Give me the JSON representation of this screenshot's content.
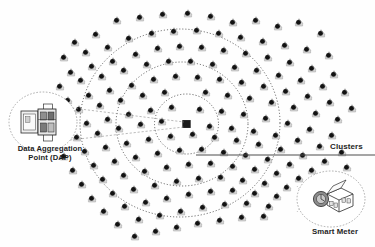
{
  "diagram": {
    "type": "network-topology",
    "background_color": "#fefefe",
    "ink_color": "#1a1a1a",
    "node_body_color": "#d9d9d9",
    "node_dot_color": "#141414",
    "ring_color": "#3a3a3a",
    "leader_color": "#555555"
  },
  "labels": {
    "dap": {
      "line1": "Data Aggregation",
      "line2": "Point (DAP)"
    },
    "smart_meter": "Smart Meter",
    "clusters": "Clusters"
  },
  "center_node": {
    "name": "data-aggregation-point",
    "shape": "square",
    "x": 186.5,
    "y": 124.0,
    "size": 7.5,
    "color": "#1b1b1b"
  },
  "cluster_rings": [
    {
      "id": "ring-inner",
      "cx": 186.5,
      "cy": 124.0,
      "rx": 32,
      "ry": 30,
      "dash": "1.1 2.0"
    },
    {
      "id": "ring-middle",
      "cx": 182.0,
      "cy": 124.0,
      "rx": 66,
      "ry": 62,
      "dash": "1.1 2.0"
    },
    {
      "id": "ring-outer",
      "cx": 180.0,
      "cy": 123.0,
      "rx": 100,
      "ry": 94,
      "dash": "1.1 2.0"
    }
  ],
  "clusters_leader": {
    "x1": 196,
    "y1": 155,
    "x2": 375,
    "y2": 155
  },
  "dap_callout": {
    "circle": {
      "cx": 43,
      "cy": 122,
      "rx": 34,
      "ry": 30
    },
    "leader_wedge": [
      {
        "x1": 72,
        "y1": 108,
        "x2": 184,
        "y2": 122
      },
      {
        "x1": 70,
        "y1": 140,
        "x2": 184,
        "y2": 127
      }
    ]
  },
  "smart_meter_callout": {
    "circle": {
      "cx": 331,
      "cy": 199,
      "rx": 34,
      "ry": 28
    },
    "leader_wedge": [
      {
        "x1": 300,
        "y1": 190,
        "x2": 297,
        "y2": 186
      },
      {
        "x1": 300,
        "y1": 208,
        "x2": 297,
        "y2": 212
      }
    ]
  },
  "meter_nodes": [
    [
      75,
      42
    ],
    [
      96,
      34
    ],
    [
      117,
      20
    ],
    [
      140,
      17
    ],
    [
      163,
      14
    ],
    [
      188,
      13
    ],
    [
      211,
      16
    ],
    [
      233,
      22
    ],
    [
      256,
      20
    ],
    [
      278,
      26
    ],
    [
      299,
      22
    ],
    [
      321,
      33
    ],
    [
      64,
      57
    ],
    [
      86,
      52
    ],
    [
      108,
      47
    ],
    [
      129,
      38
    ],
    [
      152,
      33
    ],
    [
      174,
      31
    ],
    [
      197,
      30
    ],
    [
      219,
      33
    ],
    [
      241,
      37
    ],
    [
      263,
      41
    ],
    [
      285,
      45
    ],
    [
      307,
      49
    ],
    [
      329,
      55
    ],
    [
      71,
      72
    ],
    [
      92,
      66
    ],
    [
      113,
      61
    ],
    [
      136,
      54
    ],
    [
      158,
      48
    ],
    [
      180,
      46
    ],
    [
      202,
      47
    ],
    [
      224,
      50
    ],
    [
      246,
      53
    ],
    [
      268,
      57
    ],
    [
      290,
      62
    ],
    [
      312,
      68
    ],
    [
      334,
      74
    ],
    [
      60,
      86
    ],
    [
      81,
      80
    ],
    [
      102,
      76
    ],
    [
      124,
      70
    ],
    [
      147,
      64
    ],
    [
      169,
      61
    ],
    [
      191,
      61
    ],
    [
      213,
      64
    ],
    [
      235,
      67
    ],
    [
      257,
      70
    ],
    [
      279,
      75
    ],
    [
      301,
      80
    ],
    [
      323,
      86
    ],
    [
      345,
      92
    ],
    [
      68,
      100
    ],
    [
      89,
      95
    ],
    [
      110,
      90
    ],
    [
      132,
      85
    ],
    [
      154,
      79
    ],
    [
      176,
      76
    ],
    [
      198,
      77
    ],
    [
      220,
      79
    ],
    [
      242,
      82
    ],
    [
      264,
      86
    ],
    [
      286,
      91
    ],
    [
      308,
      96
    ],
    [
      330,
      102
    ],
    [
      352,
      108
    ],
    [
      58,
      114
    ],
    [
      79,
      109
    ],
    [
      100,
      105
    ],
    [
      121,
      100
    ],
    [
      143,
      95
    ],
    [
      165,
      92
    ],
    [
      206,
      92
    ],
    [
      228,
      95
    ],
    [
      250,
      98
    ],
    [
      272,
      102
    ],
    [
      294,
      107
    ],
    [
      316,
      113
    ],
    [
      338,
      119
    ],
    [
      66,
      128
    ],
    [
      87,
      123
    ],
    [
      108,
      119
    ],
    [
      129,
      114
    ],
    [
      151,
      110
    ],
    [
      172,
      107
    ],
    [
      200,
      109
    ],
    [
      222,
      111
    ],
    [
      244,
      114
    ],
    [
      266,
      118
    ],
    [
      288,
      123
    ],
    [
      310,
      129
    ],
    [
      332,
      135
    ],
    [
      56,
      142
    ],
    [
      77,
      137
    ],
    [
      98,
      133
    ],
    [
      119,
      128
    ],
    [
      141,
      124
    ],
    [
      162,
      121
    ],
    [
      210,
      126
    ],
    [
      232,
      128
    ],
    [
      254,
      131
    ],
    [
      276,
      135
    ],
    [
      298,
      140
    ],
    [
      320,
      146
    ],
    [
      342,
      152
    ],
    [
      64,
      156
    ],
    [
      85,
      151
    ],
    [
      106,
      147
    ],
    [
      127,
      143
    ],
    [
      149,
      139
    ],
    [
      171,
      136
    ],
    [
      193,
      134
    ],
    [
      215,
      137
    ],
    [
      237,
      140
    ],
    [
      259,
      144
    ],
    [
      281,
      149
    ],
    [
      303,
      155
    ],
    [
      325,
      161
    ],
    [
      347,
      167
    ],
    [
      73,
      170
    ],
    [
      94,
      165
    ],
    [
      115,
      161
    ],
    [
      136,
      157
    ],
    [
      158,
      153
    ],
    [
      180,
      150
    ],
    [
      202,
      149
    ],
    [
      224,
      152
    ],
    [
      246,
      155
    ],
    [
      268,
      159
    ],
    [
      290,
      164
    ],
    [
      312,
      170
    ],
    [
      82,
      184
    ],
    [
      103,
      179
    ],
    [
      124,
      175
    ],
    [
      145,
      171
    ],
    [
      167,
      167
    ],
    [
      189,
      164
    ],
    [
      211,
      163
    ],
    [
      233,
      166
    ],
    [
      255,
      169
    ],
    [
      277,
      173
    ],
    [
      299,
      178
    ],
    [
      92,
      198
    ],
    [
      113,
      193
    ],
    [
      134,
      189
    ],
    [
      155,
      185
    ],
    [
      177,
      181
    ],
    [
      199,
      178
    ],
    [
      221,
      177
    ],
    [
      243,
      180
    ],
    [
      265,
      183
    ],
    [
      287,
      187
    ],
    [
      104,
      211
    ],
    [
      125,
      206
    ],
    [
      146,
      202
    ],
    [
      167,
      198
    ],
    [
      189,
      194
    ],
    [
      211,
      191
    ],
    [
      233,
      190
    ],
    [
      255,
      193
    ],
    [
      277,
      196
    ],
    [
      118,
      224
    ],
    [
      139,
      219
    ],
    [
      160,
      215
    ],
    [
      181,
      211
    ],
    [
      203,
      207
    ],
    [
      225,
      204
    ],
    [
      247,
      203
    ],
    [
      269,
      206
    ],
    [
      135,
      236
    ],
    [
      156,
      231
    ],
    [
      177,
      227
    ],
    [
      198,
      223
    ],
    [
      220,
      220
    ],
    [
      242,
      217
    ],
    [
      264,
      216
    ]
  ]
}
